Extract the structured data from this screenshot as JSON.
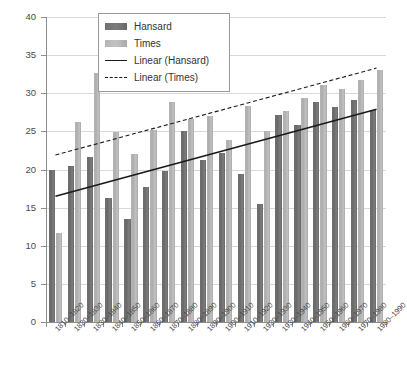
{
  "chart_data": {
    "type": "bar",
    "title": "",
    "xlabel": "",
    "ylabel": "",
    "ylim": [
      0,
      40
    ],
    "ytick_step": 5,
    "yticks": [
      0,
      5,
      10,
      15,
      20,
      25,
      30,
      35,
      40
    ],
    "grid": true,
    "legend_position": "top-center",
    "categories": [
      "1810–1820",
      "1820–1830",
      "1830–1840",
      "1840–1850",
      "1850–1860",
      "1860–1870",
      "1870–1880",
      "1880–1890",
      "1890–1900",
      "1900–1910",
      "1910–1920",
      "1920–1930",
      "1930–1940",
      "1940–1950",
      "1950–1960",
      "1960–1970",
      "1970–1980",
      "1980–1990"
    ],
    "series": [
      {
        "name": "Hansard",
        "color": "#6f6f6f",
        "values": [
          20.0,
          20.5,
          21.7,
          16.2,
          13.5,
          17.7,
          19.8,
          25.0,
          21.3,
          22.2,
          19.4,
          15.5,
          27.2,
          25.9,
          28.9,
          28.2,
          29.1,
          27.8
        ]
      },
      {
        "name": "Times",
        "color": "#b4b4b4",
        "values": [
          11.7,
          26.2,
          32.7,
          24.9,
          22.1,
          25.2,
          28.8,
          26.6,
          27.0,
          23.9,
          28.3,
          25.0,
          27.7,
          29.4,
          31.1,
          30.5,
          31.8,
          33.1
        ]
      }
    ],
    "trendlines": [
      {
        "name": "Linear (Hansard)",
        "style": "solid",
        "color": "#1a1a1a",
        "y_start": 16.5,
        "y_end": 27.9
      },
      {
        "name": "Linear (Times)",
        "style": "dashed",
        "color": "#1a1a1a",
        "y_start": 21.9,
        "y_end": 33.3
      }
    ],
    "legend": [
      {
        "label": "Hansard",
        "marker": "bar-dark"
      },
      {
        "label": "Times",
        "marker": "bar-light"
      },
      {
        "label": "Linear (Hansard)",
        "marker": "line-solid"
      },
      {
        "label": "Linear (Times)",
        "marker": "line-dashed"
      }
    ]
  }
}
